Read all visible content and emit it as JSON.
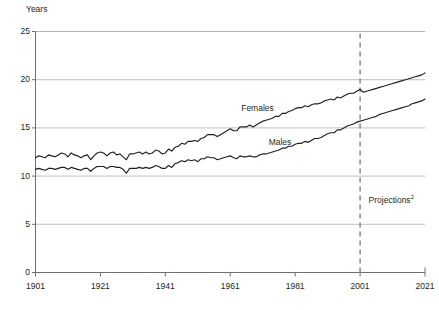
{
  "chart_data": {
    "type": "line",
    "title": "",
    "subtitle": "",
    "xlabel": "",
    "ylabel": "Years",
    "ylim": [
      0,
      25
    ],
    "xlim": [
      1901,
      2021
    ],
    "yticks": [
      0,
      5,
      10,
      15,
      20,
      25
    ],
    "xticks": [
      1901,
      1921,
      1941,
      1961,
      1981,
      2001,
      2021
    ],
    "grid": "horizontal",
    "legend_position": "inline-annotations",
    "annotations": [
      {
        "text": "Females",
        "x": 1973,
        "y": 17.0
      },
      {
        "text": "Males",
        "x": 1979,
        "y": 13.4
      },
      {
        "text": "Projections",
        "superscript": "2",
        "x": 2003,
        "y": 7.4
      }
    ],
    "projection_divider": {
      "x": 2001,
      "style": "dashed"
    },
    "x": [
      1901,
      1902,
      1903,
      1904,
      1905,
      1906,
      1907,
      1908,
      1909,
      1910,
      1911,
      1912,
      1913,
      1914,
      1915,
      1916,
      1917,
      1918,
      1919,
      1920,
      1921,
      1922,
      1923,
      1924,
      1925,
      1926,
      1927,
      1928,
      1929,
      1930,
      1931,
      1932,
      1933,
      1934,
      1935,
      1936,
      1937,
      1938,
      1939,
      1940,
      1941,
      1942,
      1943,
      1944,
      1945,
      1946,
      1947,
      1948,
      1949,
      1950,
      1951,
      1952,
      1953,
      1954,
      1955,
      1956,
      1957,
      1958,
      1959,
      1960,
      1961,
      1962,
      1963,
      1964,
      1965,
      1966,
      1967,
      1968,
      1969,
      1970,
      1971,
      1972,
      1973,
      1974,
      1975,
      1976,
      1977,
      1978,
      1979,
      1980,
      1981,
      1982,
      1983,
      1984,
      1985,
      1986,
      1987,
      1988,
      1989,
      1990,
      1991,
      1992,
      1993,
      1994,
      1995,
      1996,
      1997,
      1998,
      1999,
      2000,
      2001,
      2002,
      2003,
      2004,
      2005,
      2006,
      2007,
      2008,
      2009,
      2010,
      2011,
      2012,
      2013,
      2014,
      2015,
      2016,
      2017,
      2018,
      2019,
      2020,
      2021
    ],
    "series": [
      {
        "name": "Females",
        "values": [
          11.9,
          12.1,
          12.0,
          11.9,
          12.2,
          12.1,
          12.0,
          12.2,
          12.4,
          12.3,
          12.0,
          12.4,
          12.2,
          12.1,
          11.9,
          12.1,
          12.2,
          11.7,
          12.1,
          12.4,
          12.5,
          12.4,
          12.1,
          12.4,
          12.5,
          12.2,
          12.3,
          12.0,
          11.7,
          12.3,
          12.3,
          12.4,
          12.5,
          12.3,
          12.5,
          12.3,
          12.4,
          12.7,
          12.6,
          12.3,
          12.4,
          12.8,
          12.6,
          13.0,
          13.1,
          13.4,
          13.3,
          13.6,
          13.6,
          13.7,
          13.6,
          13.9,
          14.0,
          14.3,
          14.3,
          14.3,
          14.1,
          14.3,
          14.5,
          14.7,
          14.9,
          14.7,
          14.7,
          15.1,
          15.1,
          15.1,
          15.3,
          15.1,
          15.3,
          15.5,
          15.7,
          15.8,
          15.9,
          16.0,
          16.2,
          16.2,
          16.5,
          16.5,
          16.7,
          16.8,
          17.0,
          17.1,
          17.1,
          17.3,
          17.2,
          17.4,
          17.5,
          17.5,
          17.6,
          17.8,
          17.9,
          18.0,
          17.9,
          18.2,
          18.1,
          18.3,
          18.5,
          18.6,
          18.6,
          18.8,
          19.0,
          18.7,
          18.8,
          18.9,
          19.0,
          19.1,
          19.2,
          19.3,
          19.4,
          19.5,
          19.6,
          19.7,
          19.8,
          19.9,
          20.0,
          20.1,
          20.2,
          20.3,
          20.4,
          20.5,
          20.7
        ]
      },
      {
        "name": "Males",
        "values": [
          10.7,
          10.8,
          10.7,
          10.6,
          10.8,
          10.8,
          10.7,
          10.8,
          10.9,
          10.9,
          10.7,
          10.9,
          10.8,
          10.7,
          10.6,
          10.8,
          10.8,
          10.5,
          10.8,
          11.0,
          11.0,
          11.0,
          10.8,
          11.0,
          11.0,
          10.9,
          10.9,
          10.7,
          10.3,
          10.8,
          10.8,
          10.8,
          10.9,
          10.8,
          10.9,
          10.8,
          10.9,
          11.1,
          11.0,
          10.8,
          10.8,
          11.1,
          10.9,
          11.3,
          11.4,
          11.6,
          11.5,
          11.7,
          11.6,
          11.7,
          11.5,
          11.8,
          11.8,
          12.0,
          11.9,
          11.9,
          11.7,
          11.8,
          11.9,
          12.0,
          12.1,
          11.9,
          11.8,
          12.1,
          12.0,
          12.0,
          12.1,
          12.0,
          12.0,
          12.2,
          12.3,
          12.3,
          12.4,
          12.5,
          12.6,
          12.7,
          12.9,
          12.9,
          13.1,
          13.1,
          13.3,
          13.4,
          13.4,
          13.6,
          13.5,
          13.7,
          13.9,
          13.9,
          14.0,
          14.2,
          14.4,
          14.5,
          14.5,
          14.8,
          14.8,
          15.0,
          15.2,
          15.3,
          15.4,
          15.6,
          15.7,
          15.8,
          15.9,
          16.0,
          16.1,
          16.2,
          16.4,
          16.5,
          16.6,
          16.7,
          16.8,
          16.9,
          17.0,
          17.1,
          17.2,
          17.3,
          17.5,
          17.6,
          17.7,
          17.8,
          18.0
        ]
      }
    ]
  },
  "colors": {
    "line": "#231f20",
    "grid": "#b0b0b0",
    "axis": "#6d6e71",
    "text": "#231f20",
    "divider": "#808080",
    "background": "#ffffff"
  }
}
